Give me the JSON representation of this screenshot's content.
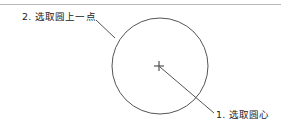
{
  "diagram": {
    "title": "",
    "labels": {
      "point_on_circle": "2. 选取圆上一点",
      "circle_center": "1. 选取圆心"
    },
    "circle": {
      "cx": 160,
      "cy": 66,
      "r": 48,
      "stroke": "#555555"
    },
    "center_marker": {
      "type": "plus",
      "x": 159,
      "y": 66
    },
    "colors": {
      "line": "#555555",
      "text": "#222222",
      "rule": "#b8b8b8",
      "background": "#ffffff"
    }
  }
}
